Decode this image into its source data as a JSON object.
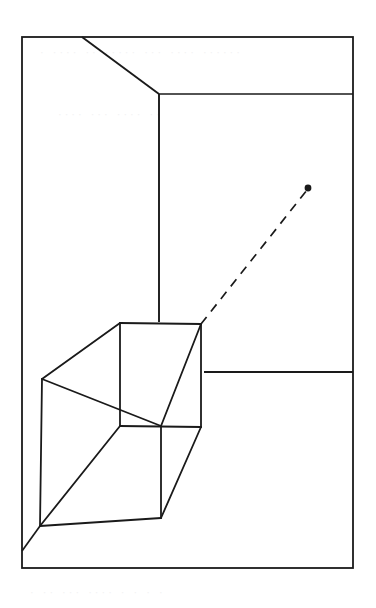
{
  "figure": {
    "medium": "scanned ink line drawing on white paper",
    "background_color": "#ffffff",
    "ink_color": "#1a1a1a",
    "ghost_color": "#f2f2f3",
    "canvas": {
      "width": 376,
      "height": 608
    }
  },
  "ghost_text": {
    "top": "· ···· ·· ····· ··· ···· ······",
    "middle": "···· ··· ···· ··",
    "bottom": "· ·· ··· ···· · · · ·"
  },
  "geometry": {
    "frame": {
      "name": "outer-picture-frame",
      "x": 22,
      "y": 37,
      "width": 331,
      "height": 531,
      "stroke_width": 1.8
    },
    "room": {
      "ceiling_diagonal": {
        "name": "ceiling-edge",
        "x1": 82,
        "y1": 37,
        "x2": 159,
        "y2": 94
      },
      "ceiling_horizontal": {
        "name": "ceiling-right-edge",
        "x1": 159,
        "y1": 94,
        "x2": 353,
        "y2": 94
      },
      "corner_vertical": {
        "name": "wall-corner-edge",
        "x1": 159,
        "y1": 94,
        "x2": 159,
        "y2": 322
      },
      "floor_horizontal_right": {
        "name": "floor-right-edge",
        "x1": 204,
        "y1": 372,
        "x2": 353,
        "y2": 372
      },
      "floor_diagonal_left": {
        "name": "floor-left-edge",
        "x1": 22,
        "y1": 551,
        "x2": 40,
        "y2": 526
      }
    },
    "box": {
      "name": "wireframe-box",
      "vertices": {
        "front_top_left": {
          "x": 42,
          "y": 379
        },
        "front_top_right": {
          "x": 161,
          "y": 426
        },
        "front_bottom_left": {
          "x": 40,
          "y": 526
        },
        "front_bottom_right": {
          "x": 161,
          "y": 518
        },
        "back_top_left": {
          "x": 120,
          "y": 323
        },
        "back_top_right": {
          "x": 201,
          "y": 324
        },
        "back_bottom_left": {
          "x": 120,
          "y": 426
        },
        "back_bottom_right": {
          "x": 201,
          "y": 427
        }
      },
      "edges": [
        [
          "front_top_left",
          "front_top_right"
        ],
        [
          "front_top_right",
          "front_bottom_right"
        ],
        [
          "front_bottom_right",
          "front_bottom_left"
        ],
        [
          "front_bottom_left",
          "front_top_left"
        ],
        [
          "back_top_left",
          "back_top_right"
        ],
        [
          "back_top_right",
          "back_bottom_right"
        ],
        [
          "back_bottom_right",
          "back_bottom_left"
        ],
        [
          "back_bottom_left",
          "back_top_left"
        ],
        [
          "front_top_left",
          "back_top_left"
        ],
        [
          "front_top_right",
          "back_top_right"
        ],
        [
          "front_bottom_right",
          "back_bottom_right"
        ],
        [
          "front_bottom_left",
          "back_bottom_left"
        ]
      ]
    },
    "ray": {
      "name": "dashed-sight-ray",
      "x1": 201,
      "y1": 324,
      "x2": 307,
      "y2": 190,
      "dash_pattern": "9 7",
      "stroke_width": 1.7
    },
    "point": {
      "name": "floating-point-marker",
      "x": 308,
      "y": 188,
      "radius": 3.4
    }
  }
}
